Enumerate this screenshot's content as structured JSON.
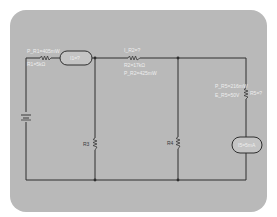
{
  "diagram": {
    "type": "circuit schematic",
    "components": {
      "r1": {
        "label_power": "P_R1=405mW",
        "label_value": "R1=5kΩ"
      },
      "meter_i1": {
        "label": "I1=?"
      },
      "r2": {
        "label_current": "I_R2=?",
        "label_value": "R2=17kΩ",
        "label_power": "P_R2=425mW"
      },
      "r3": {
        "label": "R3"
      },
      "r4": {
        "label": "R4"
      },
      "r5": {
        "label_power": "P_R5=216mW",
        "label_voltage": "E_R5=50V",
        "label_value": "R5=?"
      },
      "meter_i5": {
        "label": "I5=5mA"
      },
      "battery": {
        "label": ""
      }
    }
  },
  "colors": {
    "panel": "#b9b9b9",
    "wire": "#2e2e2e",
    "label": "#eeeeee"
  }
}
